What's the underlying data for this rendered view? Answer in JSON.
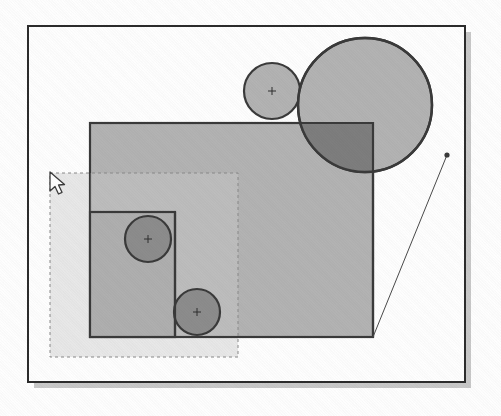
{
  "scene": {
    "title": "Vector drawing canvas with overlapping shapes",
    "description": "Scanned figure of a graphics editor canvas showing semi-transparent rectangles and circles with center crosshair markers, a dashed selection marquee, an arrow cursor and a thin drag/constraint line.",
    "canvas_width": 501,
    "canvas_height": 416,
    "background_color": "#ffffff"
  },
  "colors": {
    "paper": "#ffffff",
    "frame_stroke": "#2b2b2b",
    "frame_shadow": "#c9c9c9",
    "shape_fill_light": "#b4b4b4",
    "shape_fill_mid": "#a9a9a9",
    "shape_fill_dark": "#8d8d8d",
    "shape_fill_darker": "#7e7e7e",
    "selection_tint": "#e9e9e9",
    "shape_stroke": "#3a3a3a",
    "thin_line_stroke": "#4a4a4a",
    "marquee_stroke": "#8a8a8a",
    "cursor_fill": "#ffffff",
    "cursor_stroke": "#3b3b3b",
    "crosshair_stroke": "#2f2f2f"
  },
  "frame": {
    "name": "document-frame",
    "x": 28,
    "y": 26,
    "width": 437,
    "height": 356,
    "shadow_offset": 6,
    "stroke_width": 2
  },
  "selection_marquee": {
    "name": "selection-marquee",
    "label": "dashed selection region",
    "x": 50,
    "y": 173,
    "width": 188,
    "height": 184,
    "dash": "3 3",
    "stroke_width": 1
  },
  "rectangles": [
    {
      "name": "main-rectangle",
      "label": "Rectangle 1",
      "x": 90,
      "y": 123,
      "width": 283,
      "height": 214,
      "fill": "#b4b4b4",
      "stroke": "#3a3a3a",
      "stroke_width": 2.2,
      "opacity": 1
    },
    {
      "name": "inner-rectangle",
      "label": "Rectangle 2",
      "x": 90,
      "y": 212,
      "width": 85,
      "height": 125,
      "fill": "#b0b0b0",
      "stroke": "#3a3a3a",
      "stroke_width": 2.2,
      "opacity": 1
    }
  ],
  "circles": [
    {
      "name": "circle-large",
      "label": "Ellipse 1",
      "cx": 365,
      "cy": 105,
      "r": 67,
      "fill": "#b4b4b4",
      "stroke": "#3a3a3a",
      "stroke_width": 2.4,
      "has_center_marker": false
    },
    {
      "name": "circle-small-top",
      "label": "Ellipse 2",
      "cx": 272,
      "cy": 91,
      "r": 28,
      "fill": "#b4b4b4",
      "stroke": "#3a3a3a",
      "stroke_width": 2.2,
      "has_center_marker": true
    },
    {
      "name": "circle-upper-left",
      "label": "Ellipse 3",
      "cx": 148,
      "cy": 239,
      "r": 23,
      "fill": "#8d8d8d",
      "stroke": "#3a3a3a",
      "stroke_width": 2.2,
      "has_center_marker": true
    },
    {
      "name": "circle-lower-left",
      "label": "Ellipse 4",
      "cx": 197,
      "cy": 312,
      "r": 23,
      "fill": "#8d8d8d",
      "stroke": "#3a3a3a",
      "stroke_width": 2.2,
      "has_center_marker": true
    }
  ],
  "overlap_region": {
    "name": "circle-rect-intersection",
    "label": "darker intersection of large circle and main rectangle",
    "fill": "#7e7e7e"
  },
  "drag_line": {
    "name": "drag-constraint-line",
    "label": "thin line from circle handle to rectangle corner",
    "x1": 447,
    "y1": 155,
    "x2": 373,
    "y2": 337,
    "stroke_width": 1
  },
  "handle": {
    "name": "resize-handle",
    "label": "handle point on circle edge",
    "cx": 447,
    "cy": 155,
    "r": 2.6
  },
  "cursor": {
    "name": "mouse-cursor",
    "label": "arrow pointer",
    "x": 50,
    "y": 172
  },
  "center_marker": {
    "name": "center-crosshair",
    "label": "center crosshair marker",
    "arm_length": 4,
    "stroke_width": 1
  }
}
